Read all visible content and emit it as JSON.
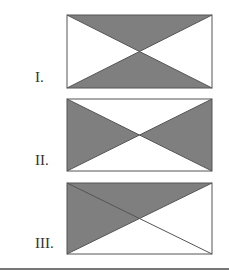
{
  "figures": [
    {
      "label": "I.",
      "shaded": [
        "top",
        "bottom"
      ]
    },
    {
      "label": "II.",
      "shaded": [
        "left",
        "right"
      ]
    },
    {
      "label": "III.",
      "shaded": [
        "top-left-half"
      ]
    }
  ],
  "colors": {
    "shade": "#7f7f7f",
    "stroke": "#555555"
  }
}
